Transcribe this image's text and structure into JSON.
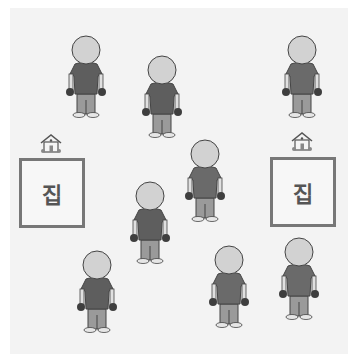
{
  "scene": {
    "background": "#f3f3f3",
    "people": [
      {
        "id": 1,
        "x": 62,
        "y": 34
      },
      {
        "id": 2,
        "x": 138,
        "y": 54
      },
      {
        "id": 3,
        "x": 278,
        "y": 34
      },
      {
        "id": 4,
        "x": 181,
        "y": 138
      },
      {
        "id": 5,
        "x": 126,
        "y": 180
      },
      {
        "id": 6,
        "x": 73,
        "y": 249
      },
      {
        "id": 7,
        "x": 205,
        "y": 244
      },
      {
        "id": 8,
        "x": 275,
        "y": 236
      }
    ],
    "houses": [
      {
        "label": "집",
        "icon": "house-icon"
      },
      {
        "label": "집",
        "icon": "house-icon"
      }
    ],
    "colors": {
      "head": "#d2d2d2",
      "shirt": "#5e5e5e",
      "pants": "#9a9a9a",
      "hands": "#3e3e3e",
      "outline": "#444444",
      "box_border": "#777777"
    }
  }
}
